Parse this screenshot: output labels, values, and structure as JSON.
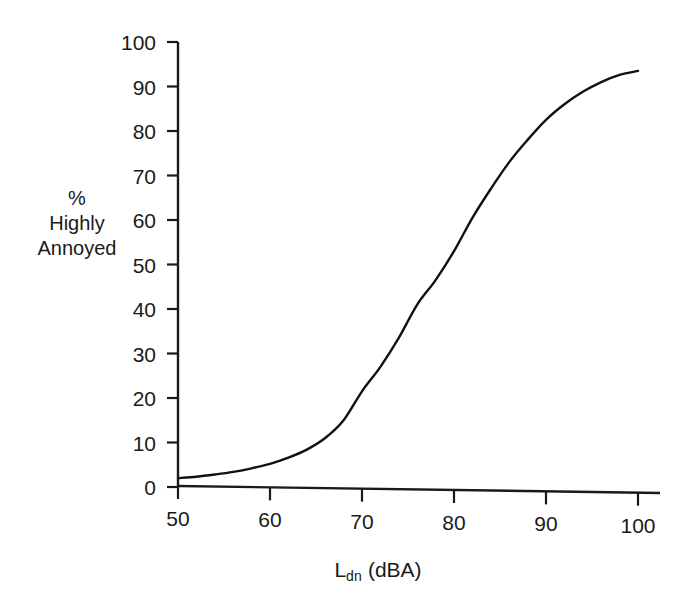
{
  "chart_data": {
    "type": "line",
    "title": "",
    "xlabel": "Ldn (dBA)",
    "xlabel_base": "L",
    "xlabel_sub": "dn",
    "xlabel_unit": " (dBA)",
    "ylabel": "% Highly Annoyed",
    "ylabel_lines": [
      "%",
      "Highly",
      "Annoyed"
    ],
    "xlim": [
      50,
      100
    ],
    "ylim": [
      0,
      100
    ],
    "xticks": [
      50,
      60,
      70,
      80,
      90,
      100
    ],
    "yticks": [
      0,
      10,
      20,
      30,
      40,
      50,
      60,
      70,
      80,
      90,
      100
    ],
    "xtick_labels": [
      "50",
      "60",
      "70",
      "80",
      "90",
      "100"
    ],
    "ytick_labels": [
      "0",
      "10",
      "20",
      "30",
      "40",
      "50",
      "60",
      "70",
      "80",
      "90",
      "100"
    ],
    "grid": false,
    "legend": false,
    "legend_position": "none",
    "line_color": "#111111",
    "line_width": 2.4,
    "series": [
      {
        "name": "Percent highly annoyed",
        "x": [
          50,
          52,
          54,
          56,
          58,
          60,
          62,
          64,
          66,
          68,
          70,
          72,
          74,
          76,
          78,
          80,
          82,
          84,
          86,
          88,
          90,
          92,
          94,
          96,
          98,
          100
        ],
        "values": [
          2.0,
          2.3,
          2.8,
          3.4,
          4.2,
          5.2,
          6.6,
          8.4,
          11.0,
          15.0,
          21.5,
          27.0,
          33.5,
          41.0,
          46.5,
          53.0,
          60.5,
          67.0,
          73.0,
          78.0,
          82.5,
          86.0,
          88.8,
          91.0,
          92.6,
          93.5
        ]
      }
    ]
  }
}
